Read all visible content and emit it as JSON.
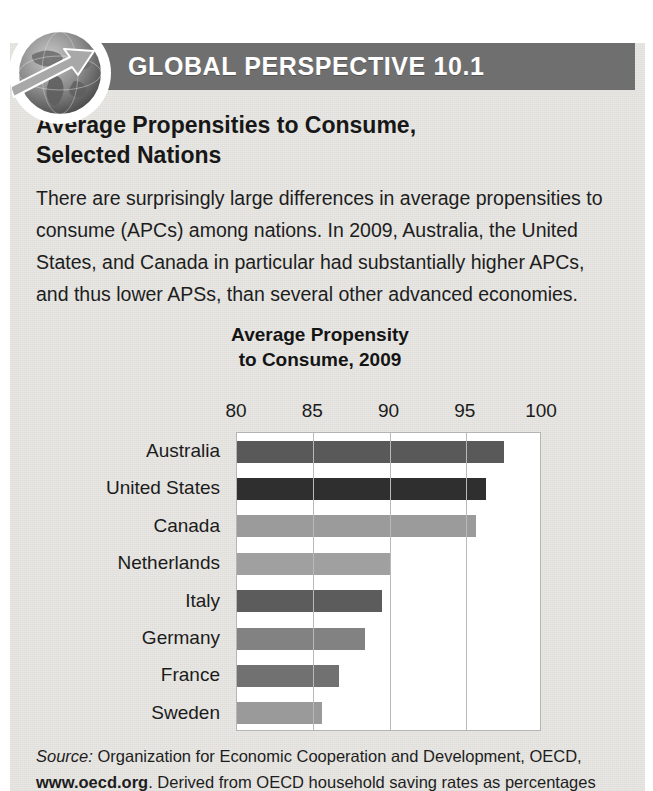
{
  "header": {
    "title": "GLOBAL PERSPECTIVE 10.1",
    "band_color": "#6f6f6f",
    "globe_icon": "globe-arrow-icon"
  },
  "headline": {
    "line1": "Average Propensities to Consume,",
    "line2": "Selected Nations"
  },
  "body": {
    "text": "There are surprisingly large differences in average propensities to consume (APCs) among nations. In 2009, Australia, the United States, and Canada in particular had substantially higher APCs, and thus lower APSs, than several other advanced economies."
  },
  "source": {
    "label": "Source:",
    "text1": " Organization for Economic Cooperation and Development, OECD,",
    "url": "www.oecd.org",
    "text2": ". Derived from OECD household saving rates as percentages"
  },
  "chart_data": {
    "type": "bar",
    "orientation": "horizontal",
    "title": "Average Propensity to Consume, 2009",
    "title_line1": "Average Propensity",
    "title_line2": "to Consume, 2009",
    "xlabel": "",
    "ylabel": "",
    "xlim": [
      80,
      100
    ],
    "ticks": [
      80,
      85,
      90,
      95,
      100
    ],
    "tick_labels": [
      "80",
      "85",
      "90",
      "95",
      "100"
    ],
    "grid": true,
    "legend": "none",
    "categories": [
      "Australia",
      "United States",
      "Canada",
      "Netherlands",
      "Italy",
      "Germany",
      "France",
      "Sweden"
    ],
    "values": [
      97.5,
      96.3,
      95.7,
      90.0,
      89.5,
      88.4,
      86.7,
      85.6
    ],
    "bar_colors": [
      "#595959",
      "#2f2f2f",
      "#9b9b9b",
      "#a0a0a0",
      "#5c5c5c",
      "#828282",
      "#717171",
      "#9a9a9a"
    ],
    "plot_background": "#ffffff",
    "gridline_color": "#b9b9b9"
  }
}
